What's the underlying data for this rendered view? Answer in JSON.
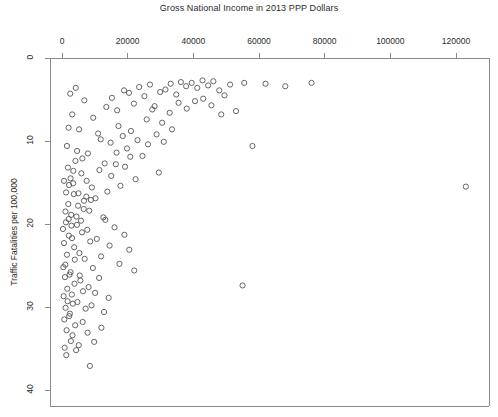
{
  "chart_data": {
    "type": "scatter",
    "title": "Gross National Income in 2013 PPP Dollars",
    "xlabel": "",
    "ylabel": "Traffic Fatalities per 100,000",
    "xlim": [
      -2000,
      130000
    ],
    "ylim": [
      0,
      42
    ],
    "y_axis_inverted": true,
    "x_axis_position": "top",
    "grid": false,
    "legend": null,
    "marker": "open-circle",
    "marker_color": "#555555",
    "xticks": [
      0,
      20000,
      40000,
      60000,
      80000,
      100000,
      120000
    ],
    "xticklabels": [
      "0",
      "20000",
      "40000",
      "60000",
      "80000",
      "100000",
      "120000"
    ],
    "yticks": [
      0,
      10,
      20,
      30,
      40
    ],
    "yticklabels": [
      "0",
      "10",
      "20",
      "30",
      "40"
    ],
    "points": [
      [
        4200,
        3.6
      ],
      [
        2500,
        4.3
      ],
      [
        6800,
        5.1
      ],
      [
        3100,
        6.8
      ],
      [
        9500,
        7.2
      ],
      [
        2000,
        8.4
      ],
      [
        5200,
        8.6
      ],
      [
        11800,
        9.8
      ],
      [
        1500,
        10.6
      ],
      [
        4600,
        11.2
      ],
      [
        7900,
        11.5
      ],
      [
        13500,
        5.9
      ],
      [
        15200,
        4.8
      ],
      [
        16800,
        6.3
      ],
      [
        18900,
        3.9
      ],
      [
        20400,
        4.2
      ],
      [
        21900,
        5.5
      ],
      [
        23500,
        3.5
      ],
      [
        25100,
        4.6
      ],
      [
        26800,
        3.2
      ],
      [
        28200,
        5.8
      ],
      [
        29900,
        4.1
      ],
      [
        31500,
        3.8
      ],
      [
        33100,
        3.1
      ],
      [
        34800,
        4.4
      ],
      [
        36200,
        2.9
      ],
      [
        37800,
        3.4
      ],
      [
        39500,
        3.0
      ],
      [
        41200,
        3.6
      ],
      [
        42800,
        2.7
      ],
      [
        44500,
        3.3
      ],
      [
        46100,
        2.8
      ],
      [
        47900,
        3.9
      ],
      [
        49500,
        4.5
      ],
      [
        51200,
        3.2
      ],
      [
        53000,
        6.4
      ],
      [
        55500,
        3.0
      ],
      [
        58000,
        10.6
      ],
      [
        62000,
        3.1
      ],
      [
        68000,
        3.4
      ],
      [
        76000,
        3.0
      ],
      [
        123000,
        15.5
      ],
      [
        55000,
        27.4
      ],
      [
        29500,
        13.8
      ],
      [
        1800,
        13.2
      ],
      [
        2600,
        14.5
      ],
      [
        3400,
        15.1
      ],
      [
        4100,
        12.4
      ],
      [
        5000,
        16.3
      ],
      [
        5900,
        13.9
      ],
      [
        6700,
        17.2
      ],
      [
        7500,
        14.8
      ],
      [
        8300,
        18.4
      ],
      [
        9100,
        15.6
      ],
      [
        10200,
        16.9
      ],
      [
        11400,
        13.5
      ],
      [
        12600,
        19.2
      ],
      [
        13800,
        16.1
      ],
      [
        15000,
        14.2
      ],
      [
        16400,
        12.8
      ],
      [
        17800,
        15.4
      ],
      [
        19200,
        13.1
      ],
      [
        20800,
        11.9
      ],
      [
        22400,
        14.6
      ],
      [
        1200,
        19.8
      ],
      [
        2100,
        21.4
      ],
      [
        2900,
        20.2
      ],
      [
        3700,
        22.8
      ],
      [
        4400,
        19.1
      ],
      [
        5300,
        23.5
      ],
      [
        6100,
        21.0
      ],
      [
        6900,
        24.2
      ],
      [
        7700,
        20.7
      ],
      [
        8600,
        22.1
      ],
      [
        9400,
        25.3
      ],
      [
        10600,
        21.8
      ],
      [
        11900,
        23.9
      ],
      [
        13200,
        19.5
      ],
      [
        14500,
        22.6
      ],
      [
        16000,
        20.4
      ],
      [
        17500,
        24.8
      ],
      [
        19000,
        21.3
      ],
      [
        20500,
        23.1
      ],
      [
        22000,
        25.6
      ],
      [
        900,
        26.4
      ],
      [
        1600,
        27.8
      ],
      [
        2300,
        26.1
      ],
      [
        3000,
        28.5
      ],
      [
        3800,
        27.2
      ],
      [
        4700,
        29.4
      ],
      [
        5600,
        26.8
      ],
      [
        6400,
        28.1
      ],
      [
        7200,
        30.2
      ],
      [
        8100,
        27.6
      ],
      [
        9000,
        29.8
      ],
      [
        10100,
        28.3
      ],
      [
        11300,
        26.5
      ],
      [
        12800,
        30.6
      ],
      [
        14200,
        28.9
      ],
      [
        700,
        31.5
      ],
      [
        1400,
        32.8
      ],
      [
        2200,
        31.1
      ],
      [
        3200,
        33.4
      ],
      [
        4000,
        32.2
      ],
      [
        5100,
        34.6
      ],
      [
        6300,
        31.8
      ],
      [
        7800,
        33.1
      ],
      [
        9800,
        34.2
      ],
      [
        12000,
        32.5
      ],
      [
        600,
        22.3
      ],
      [
        1000,
        24.9
      ],
      [
        1900,
        17.6
      ],
      [
        2800,
        18.9
      ],
      [
        3600,
        16.4
      ],
      [
        4900,
        17.8
      ],
      [
        5800,
        19.6
      ],
      [
        6600,
        18.2
      ],
      [
        7400,
        16.7
      ],
      [
        8800,
        17.1
      ],
      [
        500,
        28.7
      ],
      [
        1100,
        30.1
      ],
      [
        1700,
        29.3
      ],
      [
        2400,
        30.8
      ],
      [
        3300,
        29.6
      ],
      [
        800,
        34.9
      ],
      [
        1300,
        35.8
      ],
      [
        2700,
        34.1
      ],
      [
        4300,
        35.2
      ],
      [
        8500,
        37.1
      ],
      [
        400,
        25.2
      ],
      [
        1500,
        23.7
      ],
      [
        2600,
        25.8
      ],
      [
        3900,
        24.3
      ],
      [
        5400,
        26.2
      ],
      [
        300,
        20.6
      ],
      [
        1050,
        18.5
      ],
      [
        2050,
        19.4
      ],
      [
        3050,
        21.7
      ],
      [
        4550,
        20.1
      ],
      [
        600,
        14.8
      ],
      [
        1250,
        16.2
      ],
      [
        2150,
        15.3
      ],
      [
        3450,
        13.6
      ],
      [
        6200,
        12.1
      ],
      [
        18500,
        9.4
      ],
      [
        14800,
        10.2
      ],
      [
        11000,
        9.1
      ],
      [
        17200,
        8.2
      ],
      [
        23000,
        9.9
      ],
      [
        25800,
        7.4
      ],
      [
        21000,
        8.8
      ],
      [
        16600,
        11.4
      ],
      [
        13000,
        12.7
      ],
      [
        19800,
        10.9
      ],
      [
        27500,
        6.2
      ],
      [
        30500,
        7.8
      ],
      [
        32800,
        6.6
      ],
      [
        35500,
        5.4
      ],
      [
        38000,
        6.1
      ],
      [
        40500,
        5.2
      ],
      [
        43000,
        4.9
      ],
      [
        45500,
        5.7
      ],
      [
        48500,
        6.8
      ],
      [
        24500,
        11.8
      ],
      [
        26200,
        10.4
      ],
      [
        28800,
        9.2
      ],
      [
        31000,
        10.1
      ],
      [
        33500,
        8.6
      ]
    ]
  },
  "plot_geometry": {
    "box_left": 50,
    "box_right": 489,
    "box_top": 58,
    "box_bottom": 406,
    "x_pixel_at_0": 62,
    "x_pixel_per_unit": 0.0033,
    "y_pixel_at_0": 58,
    "y_pixel_per_unit": 8.3
  }
}
